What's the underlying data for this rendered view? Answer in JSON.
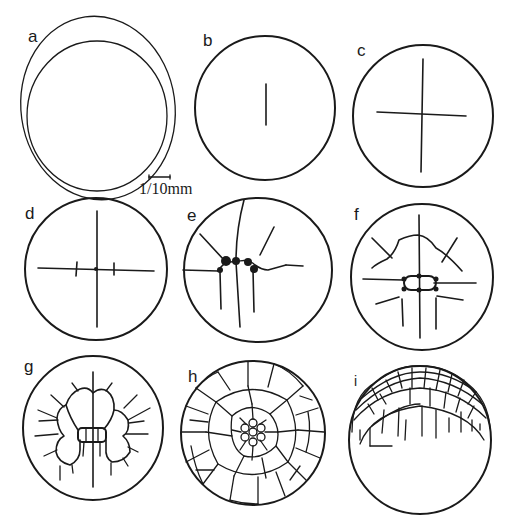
{
  "figure": {
    "type": "embryo cleavage stages diagram",
    "panels": [
      {
        "id": "a",
        "label": "a",
        "description": "uncleaved egg with membrane"
      },
      {
        "id": "b",
        "label": "b",
        "description": "first furrow"
      },
      {
        "id": "c",
        "label": "c",
        "description": "four-cell stage"
      },
      {
        "id": "d",
        "label": "d",
        "description": "eight-cell stage"
      },
      {
        "id": "e",
        "label": "e",
        "description": "sixteen-cell stage"
      },
      {
        "id": "f",
        "label": "f",
        "description": "thirty-two cell stage"
      },
      {
        "id": "g",
        "label": "g",
        "description": "further cleavage"
      },
      {
        "id": "h",
        "label": "h",
        "description": "blastodisc, many cells"
      },
      {
        "id": "i",
        "label": "i",
        "description": "lateral view of blastodisc"
      }
    ],
    "scale_bar": {
      "label": "1/10mm"
    }
  },
  "colors": {
    "ink": "#1a1a1a",
    "background": "#ffffff"
  }
}
